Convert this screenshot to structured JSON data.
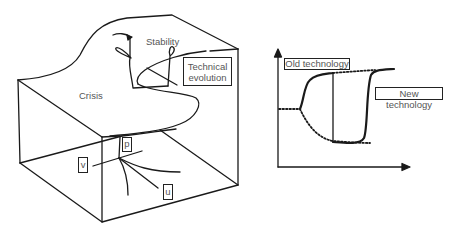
{
  "left_diagram": {
    "title": "Cusp catastrophe surface",
    "labels": {
      "crisis": "Crisis",
      "stability": "Stability",
      "technical_evolution_line1": "Technical",
      "technical_evolution_line2": "evolution"
    },
    "axes": {
      "p": "p",
      "v": "v",
      "u": "u"
    }
  },
  "right_diagram": {
    "labels": {
      "old_technology": "Old technology",
      "new_technology": "New technology"
    }
  },
  "colors": {
    "line": "#1a1a1a",
    "text": "#555555",
    "background": "#ffffff"
  }
}
